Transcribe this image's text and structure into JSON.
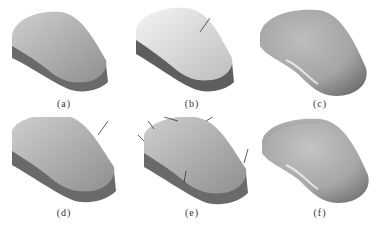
{
  "figure": {
    "panels": [
      {
        "id": "a",
        "label": "(a)",
        "style": "flat-top-extruded",
        "arrows": 0
      },
      {
        "id": "b",
        "label": "(b)",
        "style": "bright-top-extruded",
        "arrows": 1
      },
      {
        "id": "c",
        "label": "(c)",
        "style": "smooth-rounded",
        "arrows": 0
      },
      {
        "id": "d",
        "label": "(d)",
        "style": "flat-top-extruded",
        "arrows": 1
      },
      {
        "id": "e",
        "label": "(e)",
        "style": "flat-top-extruded",
        "arrows": 6
      },
      {
        "id": "f",
        "label": "(f)",
        "style": "rounded-with-seams",
        "arrows": 0
      }
    ]
  },
  "colors": {
    "top_light": "#e6e6e6",
    "top_dark": "#9a9a9a",
    "side": "#6e6e6e",
    "side_dark": "#555555",
    "arrow": "#333333"
  }
}
